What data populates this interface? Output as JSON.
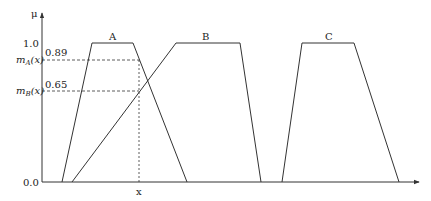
{
  "diagram": {
    "type": "fuzzy-membership-functions",
    "y_axis": {
      "label": "μ",
      "ticks": [
        "1.0",
        "0.0"
      ]
    },
    "x_axis": {
      "marker": "x"
    },
    "levels": {
      "mA": {
        "label": "m",
        "sub": "A",
        "arg": "(x)",
        "value": "0.89"
      },
      "mB": {
        "label": "m",
        "sub": "B",
        "arg": "(x)",
        "value": "0.65"
      }
    },
    "sets": [
      {
        "name": "A",
        "shape": "trapezoid"
      },
      {
        "name": "B",
        "shape": "trapezoid"
      },
      {
        "name": "C",
        "shape": "trapezoid"
      }
    ],
    "colors": {
      "line": "#333333",
      "background": "#ffffff"
    }
  }
}
